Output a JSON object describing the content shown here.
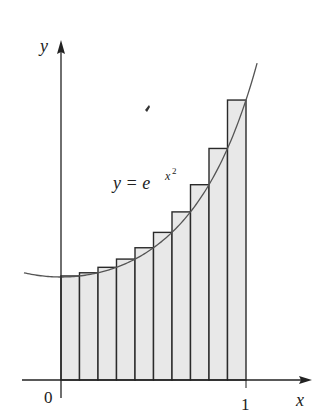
{
  "figure": {
    "axis_labels": {
      "x": "x",
      "y": "y"
    },
    "tick_labels": {
      "origin": "0",
      "x_one": "1"
    },
    "curve_label": {
      "base": "y = e",
      "exponent_base": "x",
      "exponent_power": "2"
    },
    "colors": {
      "bar_fill": "#e8e8e8",
      "bar_stroke": "#2a2a2a",
      "curve": "#555555",
      "axis": "#222222"
    }
  },
  "chart_data": {
    "type": "bar",
    "title": "",
    "function": "y = e^(x^2)",
    "xlabel": "x",
    "ylabel": "y",
    "x_ticks": [
      "0",
      "1"
    ],
    "xlim": [
      0,
      1
    ],
    "n": 10,
    "categories": [
      "0.0-0.1",
      "0.1-0.2",
      "0.2-0.3",
      "0.3-0.4",
      "0.4-0.5",
      "0.5-0.6",
      "0.6-0.7",
      "0.7-0.8",
      "0.8-0.9",
      "0.9-1.0"
    ],
    "values": [
      1.01,
      1.041,
      1.094,
      1.174,
      1.284,
      1.433,
      1.632,
      1.896,
      2.248,
      2.718
    ],
    "grid": false,
    "legend": null,
    "annotations": [
      "y = e^{x^2}"
    ]
  }
}
